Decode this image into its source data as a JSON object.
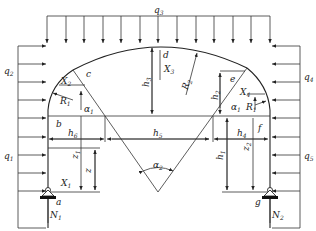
{
  "diagram": {
    "title": "",
    "loads": {
      "q1": {
        "base": "q",
        "sub": "1"
      },
      "q2": {
        "base": "q",
        "sub": "2"
      },
      "q3": {
        "base": "q",
        "sub": "3"
      },
      "q4": {
        "base": "q",
        "sub": "4"
      },
      "q5": {
        "base": "q",
        "sub": "5"
      }
    },
    "points": {
      "a": "a",
      "b": "b",
      "c": "c",
      "d": "d",
      "e": "e",
      "f": "f",
      "g": "g"
    },
    "forces": {
      "X1": {
        "base": "X",
        "sub": "1"
      },
      "X2": {
        "base": "X",
        "sub": "2"
      },
      "X3": {
        "base": "X",
        "sub": "3"
      },
      "X4": {
        "base": "X",
        "sub": "4"
      },
      "N1": {
        "base": "N",
        "sub": "1"
      },
      "N2": {
        "base": "N",
        "sub": "2"
      }
    },
    "radii": {
      "R1_left": {
        "base": "R",
        "sub": "1"
      },
      "R1_right": {
        "base": "R",
        "sub": "1"
      },
      "R2": {
        "base": "R",
        "sub": "2"
      }
    },
    "angles": {
      "alpha1_left": {
        "base": "α",
        "sub": "1"
      },
      "alpha1_right": {
        "base": "α",
        "sub": "1"
      },
      "alpha2": {
        "base": "α",
        "sub": "2"
      }
    },
    "dimensions": {
      "h1": {
        "base": "h",
        "sub": "1"
      },
      "h2": {
        "base": "h",
        "sub": "2"
      },
      "h3": {
        "base": "h",
        "sub": "3"
      },
      "h4": {
        "base": "h",
        "sub": "4"
      },
      "h5": {
        "base": "h",
        "sub": "5"
      },
      "h6": {
        "base": "h",
        "sub": "6"
      },
      "z": {
        "base": "z",
        "sub": ""
      },
      "z1": {
        "base": "z",
        "sub": "1"
      },
      "z2": {
        "base": "z",
        "sub": "2"
      }
    },
    "colors": {
      "line": "#333333",
      "support": "#111111",
      "background": "#ffffff"
    }
  }
}
